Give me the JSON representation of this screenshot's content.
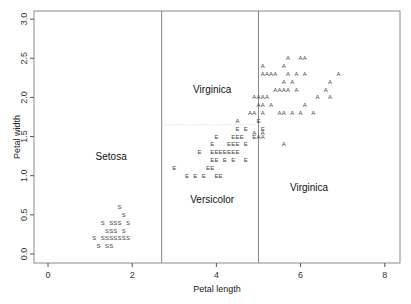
{
  "chart_data": {
    "type": "scatter",
    "title": "",
    "xlabel": "Petal length",
    "ylabel": "Petal width",
    "xlim": [
      -0.3,
      8.4
    ],
    "ylim": [
      -0.1,
      3.1
    ],
    "x_ticks": [
      "0",
      "2",
      "4",
      "6",
      "8"
    ],
    "x_tick_values": [
      0,
      2,
      4,
      6,
      8
    ],
    "y_ticks": [
      "0.0",
      "0.5",
      "1.0",
      "1.5",
      "2.0",
      "2.5",
      "3.0"
    ],
    "y_tick_values": [
      0.0,
      0.5,
      1.0,
      1.5,
      2.0,
      2.5,
      3.0
    ],
    "grid": false,
    "legend": "none (points plotted as letter glyphs S, E, A)",
    "partitions": {
      "vertical_splits_x": [
        2.7,
        5.0
      ],
      "horizontal_split": {
        "y": 1.65,
        "x_from": 2.7,
        "x_to": 5.0,
        "style": "dotted"
      }
    },
    "region_labels": [
      {
        "text": "Setosa",
        "x": 1.5,
        "y": 1.2
      },
      {
        "text": "Virginica",
        "x": 3.9,
        "y": 2.05
      },
      {
        "text": "Versicolor",
        "x": 3.9,
        "y": 0.65
      },
      {
        "text": "Virginica",
        "x": 6.2,
        "y": 0.8
      }
    ],
    "series": [
      {
        "name": "Setosa",
        "glyph": "S",
        "points": [
          [
            1.7,
            0.6
          ],
          [
            1.8,
            0.5
          ],
          [
            1.3,
            0.4
          ],
          [
            1.5,
            0.4
          ],
          [
            1.6,
            0.4
          ],
          [
            1.7,
            0.4
          ],
          [
            1.9,
            0.4
          ],
          [
            1.4,
            0.3
          ],
          [
            1.5,
            0.3
          ],
          [
            1.6,
            0.3
          ],
          [
            1.8,
            0.3
          ],
          [
            1.1,
            0.2
          ],
          [
            1.3,
            0.2
          ],
          [
            1.4,
            0.2
          ],
          [
            1.5,
            0.2
          ],
          [
            1.6,
            0.2
          ],
          [
            1.7,
            0.2
          ],
          [
            1.8,
            0.2
          ],
          [
            1.9,
            0.2
          ],
          [
            1.2,
            0.1
          ],
          [
            1.4,
            0.1
          ],
          [
            1.5,
            0.1
          ]
        ]
      },
      {
        "name": "Versicolor",
        "glyph": "E",
        "points": [
          [
            5.0,
            1.7
          ],
          [
            4.5,
            1.6
          ],
          [
            4.7,
            1.6
          ],
          [
            5.1,
            1.6
          ],
          [
            4.0,
            1.5
          ],
          [
            4.4,
            1.5
          ],
          [
            4.5,
            1.5
          ],
          [
            4.6,
            1.5
          ],
          [
            4.9,
            1.5
          ],
          [
            3.9,
            1.4
          ],
          [
            4.3,
            1.4
          ],
          [
            4.4,
            1.4
          ],
          [
            4.5,
            1.4
          ],
          [
            4.7,
            1.4
          ],
          [
            3.6,
            1.3
          ],
          [
            3.9,
            1.3
          ],
          [
            4.0,
            1.3
          ],
          [
            4.1,
            1.3
          ],
          [
            4.2,
            1.3
          ],
          [
            4.3,
            1.3
          ],
          [
            4.4,
            1.3
          ],
          [
            4.5,
            1.3
          ],
          [
            3.9,
            1.2
          ],
          [
            4.0,
            1.2
          ],
          [
            4.2,
            1.2
          ],
          [
            4.4,
            1.2
          ],
          [
            4.7,
            1.2
          ],
          [
            3.0,
            1.1
          ],
          [
            3.8,
            1.1
          ],
          [
            3.9,
            1.1
          ],
          [
            3.3,
            1.0
          ],
          [
            3.5,
            1.0
          ],
          [
            3.7,
            1.0
          ],
          [
            4.0,
            1.0
          ],
          [
            4.1,
            1.0
          ]
        ]
      },
      {
        "name": "Virginica",
        "glyph": "A",
        "points": [
          [
            5.7,
            2.5
          ],
          [
            6.0,
            2.5
          ],
          [
            6.1,
            2.5
          ],
          [
            5.1,
            2.4
          ],
          [
            5.6,
            2.4
          ],
          [
            5.1,
            2.3
          ],
          [
            5.2,
            2.3
          ],
          [
            5.3,
            2.3
          ],
          [
            5.4,
            2.3
          ],
          [
            5.7,
            2.3
          ],
          [
            5.9,
            2.3
          ],
          [
            6.1,
            2.3
          ],
          [
            6.9,
            2.3
          ],
          [
            5.6,
            2.2
          ],
          [
            5.8,
            2.2
          ],
          [
            6.7,
            2.2
          ],
          [
            5.4,
            2.1
          ],
          [
            5.5,
            2.1
          ],
          [
            5.6,
            2.1
          ],
          [
            5.7,
            2.1
          ],
          [
            5.9,
            2.1
          ],
          [
            6.6,
            2.1
          ],
          [
            4.9,
            2.0
          ],
          [
            5.0,
            2.0
          ],
          [
            5.1,
            2.0
          ],
          [
            5.2,
            2.0
          ],
          [
            6.4,
            2.0
          ],
          [
            6.7,
            2.0
          ],
          [
            5.0,
            1.9
          ],
          [
            5.1,
            1.9
          ],
          [
            5.3,
            1.9
          ],
          [
            6.1,
            1.9
          ],
          [
            4.8,
            1.8
          ],
          [
            4.9,
            1.8
          ],
          [
            5.1,
            1.8
          ],
          [
            5.5,
            1.8
          ],
          [
            5.6,
            1.8
          ],
          [
            5.8,
            1.8
          ],
          [
            6.0,
            1.8
          ],
          [
            6.3,
            1.8
          ],
          [
            4.5,
            1.7
          ],
          [
            4.9,
            1.55
          ],
          [
            5.1,
            1.5
          ],
          [
            5.0,
            1.5
          ],
          [
            5.6,
            1.4
          ],
          [
            5.1,
            1.55
          ]
        ]
      }
    ]
  }
}
